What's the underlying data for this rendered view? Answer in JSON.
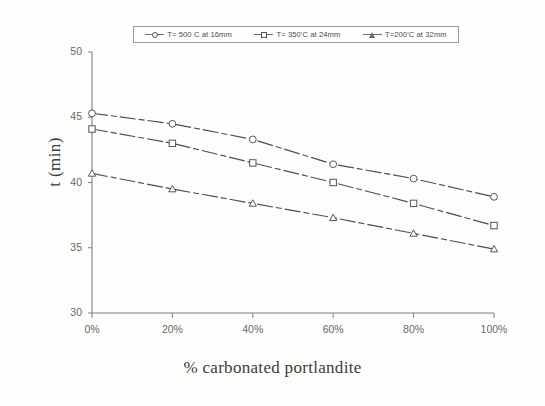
{
  "chart_data": {
    "type": "line",
    "title": "",
    "xlabel": "% carbonated portlandite",
    "ylabel": "t (min)",
    "x": [
      0,
      20,
      40,
      60,
      80,
      100
    ],
    "xtick_labels": [
      "0%",
      "20%",
      "40%",
      "60%",
      "80%",
      "100%"
    ],
    "ytick_labels": [
      "30",
      "35",
      "40",
      "45",
      "50"
    ],
    "yticks": [
      30,
      35,
      40,
      45,
      50
    ],
    "xlim": [
      0,
      100
    ],
    "ylim": [
      30,
      50
    ],
    "grid": false,
    "legend_position": "top",
    "series": [
      {
        "name": "T= 500 C at 16mm",
        "marker": "circle",
        "values": [
          45.3,
          44.5,
          43.3,
          41.4,
          40.3,
          38.9
        ]
      },
      {
        "name": "T= 350'C at 24mm",
        "marker": "square",
        "values": [
          44.1,
          43.0,
          41.5,
          40.0,
          38.4,
          36.7
        ]
      },
      {
        "name": "T=200'C at 32mm",
        "marker": "triangle",
        "values": [
          40.7,
          39.5,
          38.4,
          37.3,
          36.1,
          34.9
        ]
      }
    ]
  }
}
